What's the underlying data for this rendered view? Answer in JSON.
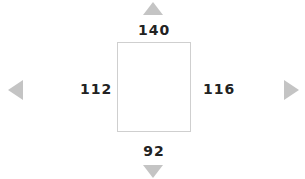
{
  "margins": {
    "top": "140",
    "bottom": "92",
    "left": "112",
    "right": "116"
  },
  "icons": {
    "up": "arrow-up-icon",
    "down": "arrow-down-icon",
    "left": "arrow-left-icon",
    "right": "arrow-right-icon"
  },
  "colors": {
    "arrow": "#c4c4c4",
    "box_border": "#cfcfcf",
    "text": "#222222"
  }
}
